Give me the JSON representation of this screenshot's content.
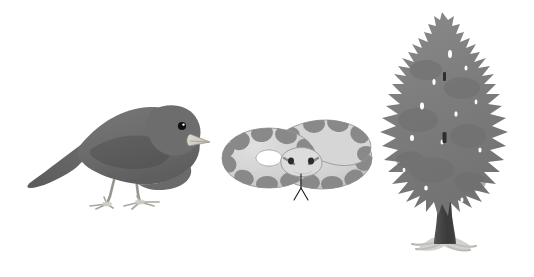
{
  "figure": {
    "background_color": "#ffffff",
    "width": 534,
    "height": 277,
    "organism_count": 3,
    "layout": "three organisms arranged left to right on a plain white background, no labels or text"
  },
  "organisms": [
    {
      "id": "bird",
      "name": "bird",
      "common_name": "dark-eyed junco",
      "description": "small dark gray perching bird in profile facing right, standing on pale legs",
      "position": "left",
      "orientation": "facing right",
      "colors": {
        "body": "#6f6f6f",
        "body_shadow": "#5d5d5d",
        "wing": "#5a5a5a",
        "head": "#6a6a6a",
        "tail": "#606060",
        "beak": "#d8d5cc",
        "beak_outline": "#8a8a84",
        "eye": "#121212",
        "eye_highlight": "#ffffff",
        "legs": "#bdbdb6",
        "legs_outline": "#8d8d87"
      },
      "parts": [
        "tail",
        "body",
        "wing",
        "head",
        "beak",
        "eye",
        "legs",
        "feet"
      ]
    },
    {
      "id": "snake",
      "name": "snake",
      "common_name": "coiled python",
      "description": "light gray snake coiled into two overlapping loops with dark gray saddle blotches, head facing the viewer with forked tongue out",
      "position": "center",
      "orientation": "coiled, head facing viewer",
      "colors": {
        "body": "#d2d2d2",
        "body_shade": "#c2c2c2",
        "outline": "#9a9a9a",
        "blotch": "#8a8a8a",
        "blotch_dark": "#7c7c7c",
        "head": "#d8d8d8",
        "eye": "#2a2a2a",
        "tongue": "#1a1a1a",
        "hole": "#ffffff"
      },
      "parts": [
        "lower coil",
        "upper coil",
        "tail",
        "head",
        "eyes",
        "forked tongue",
        "saddle blotches"
      ]
    },
    {
      "id": "tree",
      "name": "tree",
      "common_name": "conifer tree",
      "description": "tall conical evergreen tree silhouette with jagged irregular foliage, dark tapering trunk and pale exposed roots",
      "position": "right",
      "orientation": "upright",
      "colors": {
        "foliage": "#7d7d7d",
        "foliage_dark": "#6e6e6e",
        "foliage_light": "#8c8c8c",
        "trunk": "#4a4a4a",
        "trunk_dark": "#3a3a3a",
        "roots": "#b9b9b5",
        "gap": "#ffffff"
      },
      "parts": [
        "crown",
        "foliage",
        "trunk",
        "roots"
      ]
    }
  ]
}
